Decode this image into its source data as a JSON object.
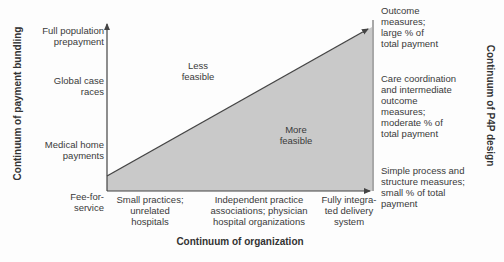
{
  "diagram": {
    "y_axis_title": "Continuum of payment bundling",
    "x_axis_title": "Continuum of organization",
    "right_axis_title": "Continuum of P4P design",
    "y_levels": [
      {
        "label": "Full population\nprepayment"
      },
      {
        "label": "Global case\nraces"
      },
      {
        "label": "Medical home\npayments"
      },
      {
        "label": "Fee-for-\nservice"
      }
    ],
    "x_levels": [
      {
        "label": "Small practices;\nunrelated\nhospitals"
      },
      {
        "label": "Independent practice\nassociations; physician\nhospital organizations"
      },
      {
        "label": "Fully integra-\nted delivery\nsystem"
      }
    ],
    "right_levels": [
      {
        "label": "Outcome\nmeasures;\nlarge % of\ntotal payment"
      },
      {
        "label": "Care coordination\nand intermediate\noutcome\nmeasures;\nmoderate % of\ntotal payment"
      },
      {
        "label": "Simple process and\nstructure measures;\nsmall % of total\npayment"
      }
    ],
    "regions": {
      "upper": "Less\nfeasible",
      "lower": "More\nfeasible"
    },
    "colors": {
      "fill": "#c9c9c9",
      "line": "#444444",
      "background": "#fdfdfd"
    }
  }
}
